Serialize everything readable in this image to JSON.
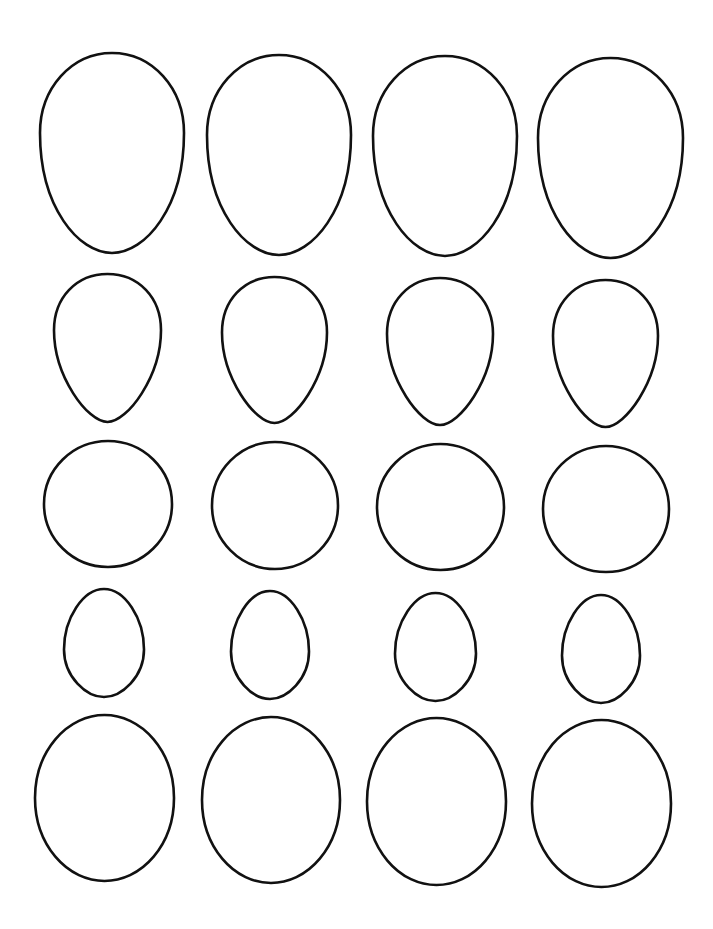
{
  "page": {
    "width": 713,
    "height": 929,
    "background": "#ffffff",
    "stroke_color": "#111111",
    "stroke_width": 2.6
  },
  "rows": [
    {
      "name": "large-tall-eggs",
      "type": "tall-egg",
      "shapes": [
        {
          "x": 40,
          "y": 53,
          "w": 144,
          "h": 200
        },
        {
          "x": 207,
          "y": 55,
          "w": 144,
          "h": 200
        },
        {
          "x": 373,
          "y": 56,
          "w": 144,
          "h": 200
        },
        {
          "x": 538,
          "y": 58,
          "w": 145,
          "h": 200
        }
      ]
    },
    {
      "name": "medium-pointed-eggs",
      "type": "pointed-egg",
      "shapes": [
        {
          "x": 54,
          "y": 274,
          "w": 107,
          "h": 148
        },
        {
          "x": 222,
          "y": 277,
          "w": 105,
          "h": 146
        },
        {
          "x": 387,
          "y": 278,
          "w": 106,
          "h": 147
        },
        {
          "x": 553,
          "y": 280,
          "w": 105,
          "h": 147
        }
      ]
    },
    {
      "name": "circles",
      "type": "circle",
      "shapes": [
        {
          "x": 44,
          "y": 441,
          "w": 128,
          "h": 126
        },
        {
          "x": 212,
          "y": 442,
          "w": 126,
          "h": 127
        },
        {
          "x": 377,
          "y": 444,
          "w": 127,
          "h": 126
        },
        {
          "x": 543,
          "y": 446,
          "w": 126,
          "h": 126
        }
      ]
    },
    {
      "name": "small-eggs",
      "type": "small-egg",
      "shapes": [
        {
          "x": 64,
          "y": 589,
          "w": 80,
          "h": 108
        },
        {
          "x": 231,
          "y": 591,
          "w": 78,
          "h": 108
        },
        {
          "x": 395,
          "y": 593,
          "w": 81,
          "h": 108
        },
        {
          "x": 562,
          "y": 595,
          "w": 78,
          "h": 108
        }
      ]
    },
    {
      "name": "large-ovals",
      "type": "oval",
      "shapes": [
        {
          "x": 35,
          "y": 715,
          "w": 139,
          "h": 166
        },
        {
          "x": 202,
          "y": 717,
          "w": 138,
          "h": 166
        },
        {
          "x": 367,
          "y": 718,
          "w": 139,
          "h": 167
        },
        {
          "x": 532,
          "y": 720,
          "w": 139,
          "h": 167
        }
      ]
    }
  ]
}
